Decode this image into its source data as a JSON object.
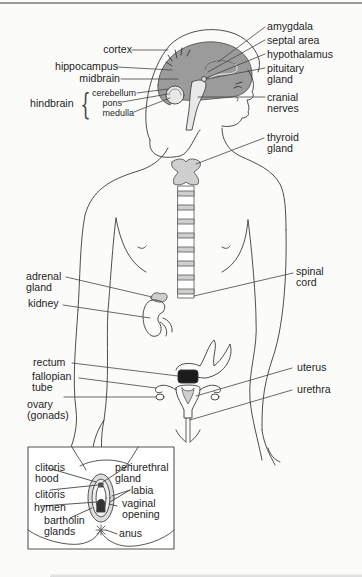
{
  "diagram": {
    "colors": {
      "brain_fill": "#9b9b9b",
      "gland_fill": "#cfcfcf",
      "line": "#3a3a3a",
      "rectum_dark": "#1c1c1c",
      "background": "#fbfbfa"
    },
    "brain_labels_left": {
      "cortex": "cortex",
      "hippocampus": "hippocampus",
      "midbrain": "midbrain",
      "hindbrain": "hindbrain",
      "cerebellum": "cerebellum",
      "pons": "pons",
      "medulla": "medulla"
    },
    "brain_labels_right": {
      "amygdala": "amygdala",
      "septal_area": "septal area",
      "hypothalamus": "hypothalamus",
      "pituitary_1": "pituitary",
      "pituitary_2": "gland",
      "cranial_1": "cranial",
      "cranial_2": "nerves"
    },
    "body_labels": {
      "thyroid_1": "thyroid",
      "thyroid_2": "gland",
      "adrenal_1": "adrenal",
      "adrenal_2": "gland",
      "kidney": "kidney",
      "spinal_1": "spinal",
      "spinal_2": "cord",
      "rectum": "rectum",
      "fallopian_1": "fallopian",
      "fallopian_2": "tube",
      "ovary_1": "ovary",
      "ovary_2": "(gonads)",
      "uterus": "uterus",
      "urethra": "urethra"
    },
    "inset_labels": {
      "clitoris_hood_1": "clitoris",
      "clitoris_hood_2": "hood",
      "clitoris": "clitoris",
      "hymen": "hymen",
      "bartholin_1": "bartholin",
      "bartholin_2": "glands",
      "periurethral_1": "periurethral",
      "periurethral_2": "gland",
      "labia": "labia",
      "vaginal_1": "vaginal",
      "vaginal_2": "opening",
      "anus": "anus"
    }
  }
}
